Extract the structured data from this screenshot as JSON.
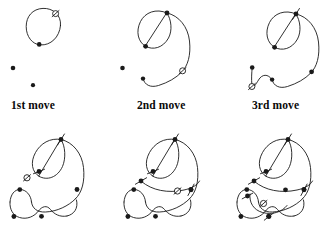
{
  "figure": {
    "background_color": "#ffffff",
    "ink_color": "#1a1a1a",
    "stroke_width": 0.9,
    "canvas": {
      "width": 336,
      "height": 226
    }
  },
  "labels": [
    {
      "id": "label-1st",
      "text": "1st move",
      "x": 11,
      "y": 109
    },
    {
      "id": "label-2nd",
      "text": "2nd move",
      "x": 137,
      "y": 109
    },
    {
      "id": "label-3rd",
      "text": "3rd move",
      "x": 252,
      "y": 109
    }
  ],
  "legend": {
    "filled_dot": "spot with free connections remaining",
    "open_circle_slashed": "dead spot (new spot just placed, slashed)",
    "cross_tick": "spot whose three connections are used up"
  },
  "panels": [
    {
      "id": "panel-1",
      "caption": "1st move",
      "move_number": 1,
      "curves": [
        "M 60.5 25.5 C 61.5 14.5 52.5 8.0 43.0 8.4 C 32.5 8.8 26.2 16.5 26.2 26.5 C 26.2 36.5 32.2 44.4 40.5 44.9 C 50.5 45.5 59.5 37.5 60.5 25.5 Z"
      ],
      "filled_dots": [
        {
          "x": 39.2,
          "y": 44.4,
          "r": 2.3
        },
        {
          "x": 13.0,
          "y": 68.0,
          "r": 2.3
        },
        {
          "x": 33.0,
          "y": 85.2,
          "r": 2.1
        }
      ],
      "open_circles": [
        {
          "x": 55.6,
          "y": 13.6,
          "r": 3.0,
          "slash_angle": 42
        }
      ],
      "cross_ticks": []
    },
    {
      "id": "panel-2",
      "caption": "2nd move",
      "move_number": 2,
      "curves": [
        "M 167.0 13.0 C 156.0 8.0 145.0 12.5 140.5 21.5 C 135.5 31.5 138.0 42.0 145.5 46.3",
        "M 145.5 46.3 C 153.0 50.5 163.0 48.0 168.5 38.0 C 172.5 30.5 171.5 20.0 167.0 13.0 Z",
        "M 167.0 13.0 C 179.0 15.5 188.0 27.0 189.5 41.0 C 191.0 55.0 188.0 66.0 181.5 72.3",
        "M 181.5 72.3 C 176.0 78.0 168.0 82.5 158.5 85.5 C 150.5 88.0 144.5 85.0 143.0 78.6"
      ],
      "filled_dots": [
        {
          "x": 167.0,
          "y": 13.0,
          "r": 2.4
        },
        {
          "x": 145.6,
          "y": 46.3,
          "r": 2.4
        },
        {
          "x": 122.5,
          "y": 68.0,
          "r": 2.3
        },
        {
          "x": 143.0,
          "y": 78.6,
          "r": 2.2
        }
      ],
      "open_circles": [
        {
          "x": 182.6,
          "y": 70.8,
          "r": 3.0,
          "slash_angle": 42
        }
      ],
      "cross_ticks": []
    },
    {
      "id": "panel-3",
      "caption": "3rd move",
      "move_number": 3,
      "curves": [
        "M 296.0 14.0 C 285.0 9.0 274.0 13.5 269.5 22.5 C 264.5 32.5 267.0 43.0 274.5 47.3",
        "M 274.5 47.3 C 282.0 51.5 292.0 49.0 297.5 39.0 C 301.5 31.5 300.5 21.0 296.0 14.0 Z",
        "M 296.0 14.0 C 308.0 16.5 317.0 28.0 318.5 42.0 C 320.0 56.0 317.0 67.0 310.5 73.3",
        "M 310.5 73.3 C 305.0 79.0 297.0 83.5 287.5 86.5 C 279.5 89.0 273.5 86.0 272.0 79.6",
        "M 272.0 79.6 C 268.0 73.5 262.0 74.0 258.5 80.0 C 255.5 85.0 253.5 87.5 252.8 87.9",
        "M 252.2 67.5 C 251.6 73.5 251.4 79.0 251.8 84.0"
      ],
      "filled_dots": [
        {
          "x": 274.6,
          "y": 47.3,
          "r": 2.4
        },
        {
          "x": 311.6,
          "y": 71.8,
          "r": 2.4
        },
        {
          "x": 252.2,
          "y": 67.5,
          "r": 2.3
        },
        {
          "x": 272.1,
          "y": 79.6,
          "r": 2.2
        }
      ],
      "open_circles": [
        {
          "x": 251.9,
          "y": 86.5,
          "r": 3.0,
          "slash_angle": 42
        }
      ],
      "cross_ticks": [
        {
          "x": 296.0,
          "y": 14.0,
          "angle": 58,
          "len": 13
        }
      ]
    },
    {
      "id": "panel-4",
      "caption": "",
      "move_number": 4,
      "curves": [
        "M 61.0 139.5 C 50.0 137.5 40.5 143.5 35.5 152.5 C 30.0 162.5 32.0 172.0 39.0 176.3",
        "M 39.0 176.3 C 47.0 181.0 57.5 177.5 62.5 166.5 C 66.0 158.5 65.5 146.0 61.0 139.5 Z",
        "M 61.0 139.5 C 73.0 142.0 82.0 153.5 83.5 167.5 C 85.0 181.5 82.0 192.5 75.5 198.8",
        "M 75.5 198.8 C 68.5 206.0 57.0 211.5 45.5 212.0 C 37.0 212.5 32.0 208.0 31.5 202.0",
        "M 31.5 202.0 C 31.0 195.0 26.0 189.5 20.0 189.5 C 14.5 189.5 10.5 194.5 10.0 202.0",
        "M 10.0 202.0 C 9.5 209.5 13.0 215.5 19.5 217.5 C 27.0 219.8 34.5 216.5 38.5 211.0",
        "M 38.5 211.0 C 42.0 206.0 47.0 205.0 50.5 209.5 C 54.0 214.0 60.0 217.5 67.0 216.0",
        "M 67.0 216.0 C 74.0 214.5 78.5 208.5 76.5 200.0"
      ],
      "filled_dots": [
        {
          "x": 77.0,
          "y": 189.5,
          "r": 2.4
        },
        {
          "x": 19.8,
          "y": 189.6,
          "r": 2.4
        },
        {
          "x": 13.9,
          "y": 216.5,
          "r": 2.4
        },
        {
          "x": 41.5,
          "y": 216.3,
          "r": 2.4
        }
      ],
      "open_circles": [
        {
          "x": 27.0,
          "y": 177.8,
          "r": 3.1,
          "slash_angle": 42
        }
      ],
      "cross_ticks": [
        {
          "x": 61.0,
          "y": 139.5,
          "angle": 58,
          "len": 13
        },
        {
          "x": 39.0,
          "y": 171.5,
          "angle": 22,
          "len": 12
        }
      ]
    },
    {
      "id": "panel-5",
      "caption": "",
      "move_number": 5,
      "curves": [
        "M 175.0 139.5 C 164.0 137.5 154.5 143.5 149.5 152.5 C 144.0 162.5 146.0 172.0 153.0 176.3",
        "M 153.0 176.3 C 161.0 181.0 171.5 177.5 176.5 166.5 C 180.0 158.5 179.5 146.0 175.0 139.5 Z",
        "M 175.0 139.5 C 187.0 142.0 196.0 153.5 197.5 167.5 C 199.0 181.5 196.0 192.5 189.5 198.8",
        "M 189.5 198.8 C 182.5 206.0 171.0 211.5 159.5 212.0 C 151.0 212.5 146.0 208.0 145.5 202.0",
        "M 145.5 202.0 C 145.0 195.0 140.0 189.5 134.0 189.5 C 128.5 189.5 124.5 194.5 124.0 202.0",
        "M 124.0 202.0 C 123.5 209.5 127.0 215.5 133.5 217.5 C 141.0 219.8 148.5 216.5 152.5 211.0",
        "M 152.5 211.0 C 156.0 206.0 161.0 205.0 164.5 209.5 C 168.0 214.0 174.0 217.5 181.0 216.0",
        "M 181.0 216.0 C 188.0 214.5 192.5 208.5 190.5 200.0",
        "M 141.5 181.5 C 152.0 190.5 168.0 193.5 184.0 190.0 C 192.0 188.3 197.5 185.0 199.5 181.0"
      ],
      "filled_dots": [
        {
          "x": 191.0,
          "y": 189.5,
          "r": 2.4
        },
        {
          "x": 133.8,
          "y": 189.6,
          "r": 2.4
        },
        {
          "x": 127.9,
          "y": 216.5,
          "r": 2.4
        },
        {
          "x": 155.5,
          "y": 216.3,
          "r": 2.4
        }
      ],
      "open_circles": [
        {
          "x": 177.5,
          "y": 191.0,
          "r": 3.1,
          "slash_angle": 42
        }
      ],
      "cross_ticks": [
        {
          "x": 175.0,
          "y": 139.5,
          "angle": 58,
          "len": 13
        },
        {
          "x": 153.0,
          "y": 171.5,
          "angle": 22,
          "len": 12
        },
        {
          "x": 141.0,
          "y": 181.0,
          "angle": 30,
          "len": 13
        },
        {
          "x": 191.0,
          "y": 189.8,
          "angle": 62,
          "len": 13
        }
      ]
    },
    {
      "id": "panel-6",
      "caption": "",
      "move_number": 6,
      "curves": [
        "M 288.0 139.5 C 277.0 137.5 267.5 143.5 262.5 152.5 C 257.0 162.5 259.0 172.0 266.0 176.3",
        "M 266.0 176.3 C 274.0 181.0 284.5 177.5 289.5 166.5 C 293.0 158.5 292.5 146.0 288.0 139.5 Z",
        "M 288.0 139.5 C 300.0 142.0 309.0 153.5 310.5 167.5 C 312.0 181.5 309.0 192.5 302.5 198.8",
        "M 302.5 198.8 C 295.5 206.0 284.0 211.5 272.5 212.0 C 264.0 212.5 259.0 208.0 258.5 202.0",
        "M 258.5 202.0 C 258.0 195.0 253.0 189.5 247.0 189.5 C 241.5 189.5 237.5 194.5 237.0 202.0",
        "M 237.0 202.0 C 236.5 209.5 240.0 215.5 246.5 217.5 C 254.0 219.8 261.5 216.5 265.5 211.0",
        "M 265.5 211.0 C 269.0 206.0 274.0 205.0 277.5 209.5 C 281.0 214.0 287.0 217.5 294.0 216.0",
        "M 294.0 216.0 C 301.0 214.5 305.5 208.5 303.5 200.0",
        "M 254.5 181.5 C 265.0 190.5 281.0 193.5 297.0 190.0 C 305.0 188.3 310.5 185.0 312.5 181.0",
        "M 250.0 194.0 C 249.0 202.5 253.5 210.0 262.5 212.5 C 272.5 215.2 282.0 212.0 287.0 205.5"
      ],
      "filled_dots": [
        {
          "x": 304.0,
          "y": 189.5,
          "r": 2.4
        },
        {
          "x": 246.8,
          "y": 189.6,
          "r": 2.4
        },
        {
          "x": 240.9,
          "y": 216.5,
          "r": 2.4
        },
        {
          "x": 268.5,
          "y": 216.3,
          "r": 2.4
        },
        {
          "x": 285.5,
          "y": 189.8,
          "r": 2.4
        }
      ],
      "open_circles": [
        {
          "x": 263.5,
          "y": 203.5,
          "r": 3.1,
          "slash_angle": 42
        }
      ],
      "cross_ticks": [
        {
          "x": 288.0,
          "y": 139.5,
          "angle": 58,
          "len": 13
        },
        {
          "x": 266.0,
          "y": 171.5,
          "angle": 22,
          "len": 12
        },
        {
          "x": 254.0,
          "y": 181.0,
          "angle": 30,
          "len": 13
        },
        {
          "x": 304.0,
          "y": 189.8,
          "angle": 62,
          "len": 13
        },
        {
          "x": 247.5,
          "y": 196.0,
          "angle": 28,
          "len": 12
        },
        {
          "x": 269.0,
          "y": 216.5,
          "angle": 38,
          "len": 12
        }
      ]
    }
  ]
}
